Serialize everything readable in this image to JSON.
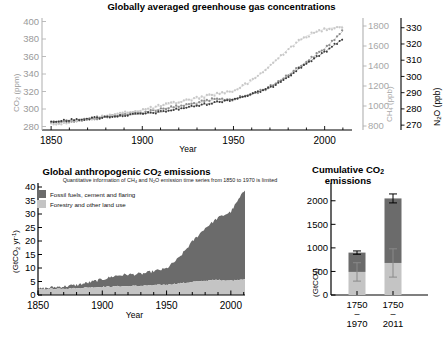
{
  "figure": {
    "background": "#ffffff",
    "colors": {
      "co2_series": "#8d8d8d",
      "ch4_series": "#c8c8c8",
      "n2o_series": "#3a3a3a",
      "fossil_fuels": "#6b6b6b",
      "forestry": "#c4c4c4",
      "axis": "#000000",
      "co2_axis_text": "#9a9a9a",
      "ch4_axis_text": "#a8a8a8",
      "n2o_axis_text": "#000000"
    }
  },
  "panel_top": {
    "title": "Globally averaged greenhouse gas concentrations",
    "xlabel": "Year",
    "x_ticks": [
      "1850",
      "1900",
      "1950",
      "2000"
    ],
    "left_axis": {
      "label_main": "CO",
      "label_sub": "2",
      "label_unit": "(ppm)",
      "ticks": [
        "280",
        "300",
        "320",
        "340",
        "360",
        "380",
        "400"
      ]
    },
    "right_axis_1": {
      "label_main": "CH",
      "label_sub": "4",
      "label_unit": "(ppb)",
      "ticks": [
        "800",
        "1000",
        "1200",
        "1400",
        "1600",
        "1800"
      ]
    },
    "right_axis_2": {
      "label_main": "N",
      "label_sub": "2",
      "label_main2": "O",
      "label_unit": "(ppb)",
      "ticks": [
        "270",
        "280",
        "290",
        "300",
        "310",
        "320",
        "330"
      ]
    }
  },
  "panel_bottom_left": {
    "title_part1": "Global anthropogenic CO",
    "title_sub": "2",
    "title_part2": " emissions",
    "subtitle_part1": "Quantitative information of CH",
    "subtitle_sub1": "4",
    "subtitle_part2": " and N",
    "subtitle_sub2": "2",
    "subtitle_part3": "O emission time series from 1850 to 1970 is limited",
    "xlabel": "Year",
    "x_ticks": [
      "1850",
      "1900",
      "1950",
      "2000"
    ],
    "y_axis": {
      "label_part1": "(GtCO",
      "label_sub": "2",
      "label_part2": " yr",
      "label_sup": "-1",
      "label_part3": ")",
      "ticks": [
        "0",
        "5",
        "10",
        "15",
        "20",
        "25",
        "30",
        "35",
        "40"
      ]
    },
    "legend": [
      {
        "label": "Fossil fuels, cement and flaring",
        "color": "#6b6b6b"
      },
      {
        "label": "Forestry and other land use",
        "color": "#c4c4c4"
      }
    ]
  },
  "panel_bottom_right": {
    "title_part1": "Cumulative CO",
    "title_sub": "2",
    "title_line2": "emissions",
    "y_axis": {
      "label_part1": "(GtCO",
      "label_sub": "2",
      "label_part2": ")",
      "ticks": [
        "0",
        "500",
        "1000",
        "1500",
        "2000"
      ]
    },
    "x_labels": [
      {
        "top": "1750",
        "dash": "–",
        "bottom": "1970"
      },
      {
        "top": "1750",
        "dash": "–",
        "bottom": "2011"
      }
    ]
  },
  "chart_data": [
    {
      "type": "scatter",
      "id": "greenhouse-gas-concentrations",
      "title": "Globally averaged greenhouse gas concentrations",
      "xlabel": "Year",
      "xlim": [
        1845,
        2015
      ],
      "grid": false,
      "legend": "none",
      "axes": [
        {
          "name": "CO2",
          "ylabel": "CO2 (ppm)",
          "ylim": [
            276,
            404
          ],
          "ticks": [
            280,
            300,
            320,
            340,
            360,
            380,
            400
          ],
          "side": "left"
        },
        {
          "name": "CH4",
          "ylabel": "CH4 (ppb)",
          "ylim": [
            760,
            1880
          ],
          "ticks": [
            800,
            1000,
            1200,
            1400,
            1600,
            1800
          ],
          "side": "right"
        },
        {
          "name": "N2O",
          "ylabel": "N2O (ppb)",
          "ylim": [
            267,
            336
          ],
          "ticks": [
            270,
            280,
            290,
            300,
            310,
            320,
            330
          ],
          "side": "right"
        }
      ],
      "series": [
        {
          "name": "CO2",
          "axis": "CO2",
          "color": "#8d8d8d",
          "x": [
            1850,
            1860,
            1870,
            1880,
            1890,
            1900,
            1910,
            1920,
            1930,
            1940,
            1950,
            1960,
            1970,
            1980,
            1990,
            2000,
            2011
          ],
          "values": [
            285,
            286,
            288,
            291,
            294,
            296,
            300,
            303,
            307,
            311,
            311,
            317,
            325,
            339,
            354,
            369,
            391
          ]
        },
        {
          "name": "CH4",
          "axis": "CH4",
          "color": "#c8c8c8",
          "x": [
            1850,
            1860,
            1870,
            1880,
            1890,
            1900,
            1910,
            1920,
            1930,
            1940,
            1950,
            1960,
            1970,
            1980,
            1990,
            2000,
            2011
          ],
          "values": [
            820,
            840,
            870,
            900,
            930,
            960,
            1000,
            1040,
            1080,
            1120,
            1150,
            1250,
            1400,
            1570,
            1700,
            1770,
            1800
          ]
        },
        {
          "name": "N2O",
          "axis": "N2O",
          "color": "#3a3a3a",
          "x": [
            1850,
            1860,
            1870,
            1880,
            1890,
            1900,
            1910,
            1920,
            1930,
            1940,
            1950,
            1960,
            1970,
            1980,
            1990,
            2000,
            2011
          ],
          "values": [
            272,
            273,
            274,
            275,
            276,
            277,
            278,
            280,
            282,
            284,
            286,
            289,
            293,
            300,
            308,
            315,
            324
          ]
        }
      ]
    },
    {
      "type": "area",
      "id": "global-anthropogenic-co2-emissions",
      "title": "Global anthropogenic CO2 emissions",
      "subtitle": "Quantitative information of CH4 and N2O emission time series from 1850 to 1970 is limited",
      "xlabel": "Year",
      "ylabel": "(GtCO2 yr-1)",
      "xlim": [
        1850,
        2011
      ],
      "ylim": [
        0,
        40
      ],
      "yticks": [
        0,
        5,
        10,
        15,
        20,
        25,
        30,
        35,
        40
      ],
      "stacked": true,
      "grid": false,
      "x": [
        1850,
        1860,
        1870,
        1880,
        1890,
        1900,
        1910,
        1920,
        1930,
        1940,
        1950,
        1960,
        1970,
        1980,
        1990,
        2000,
        2005,
        2011
      ],
      "series": [
        {
          "name": "Forestry and other land use",
          "color": "#c4c4c4",
          "values": [
            2.0,
            2.3,
            2.4,
            2.5,
            2.8,
            3.0,
            3.2,
            3.3,
            3.4,
            3.6,
            3.8,
            4.3,
            4.8,
            5.3,
            5.6,
            5.3,
            5.6,
            6.0
          ]
        },
        {
          "name": "Fossil fuels, cement and flaring",
          "color": "#6b6b6b",
          "values": [
            0.2,
            0.5,
            0.8,
            1.2,
            1.9,
            2.8,
            3.9,
            4.3,
            4.4,
            5.2,
            6.0,
            9.6,
            15.0,
            19.5,
            23.0,
            25.5,
            29.0,
            33.0
          ]
        }
      ]
    },
    {
      "type": "bar",
      "id": "cumulative-co2-emissions",
      "title": "Cumulative CO2 emissions",
      "ylabel": "(GtCO2)",
      "ylim": [
        0,
        2250
      ],
      "yticks": [
        0,
        500,
        1000,
        1500,
        2000
      ],
      "stacked": true,
      "grid": false,
      "categories": [
        "1750-1970",
        "1750-2011"
      ],
      "series": [
        {
          "name": "Forestry and other land use",
          "color": "#c4c4c4",
          "values": [
            490,
            680
          ],
          "errors": [
            195,
            300
          ]
        },
        {
          "name": "Fossil fuels, cement and flaring",
          "color": "#6b6b6b",
          "values": [
            410,
            1370
          ],
          "errors": [
            35,
            95
          ]
        }
      ],
      "totals": [
        900,
        2050
      ]
    }
  ]
}
